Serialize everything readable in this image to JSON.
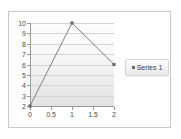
{
  "chart_data": {
    "type": "line",
    "title": "",
    "xlabel": "",
    "ylabel": "",
    "x": [
      0,
      1,
      2
    ],
    "series": [
      {
        "name": "Series 1",
        "values": [
          2,
          10,
          6
        ]
      }
    ],
    "xlim": [
      0,
      2
    ],
    "ylim": [
      2,
      10
    ],
    "xticks": [
      "0",
      "0.5",
      "1",
      "1.5",
      "2"
    ],
    "xtick_values": [
      0,
      0.5,
      1,
      1.5,
      2
    ],
    "yticks": [
      "2",
      "3",
      "4",
      "5",
      "6",
      "7",
      "8",
      "9",
      "10"
    ],
    "ytick_values": [
      2,
      3,
      4,
      5,
      6,
      7,
      8,
      9,
      10
    ],
    "grid": "horizontal",
    "legend_position": "right",
    "line_color": "#808080",
    "marker": "square",
    "marker_color": "#6b6b6b",
    "plot_bg_top": "#fdfdfd",
    "plot_bg_bottom": "#e3e3e3",
    "border_color": "#c8c8c8",
    "axis_color": "#9a9a9a",
    "gridline_color": "#d4d4d4",
    "tick_label_color": "#4a4a4a"
  },
  "legend": {
    "entries": [
      {
        "label": "Series 1",
        "marker_icon": "square-marker-icon"
      }
    ]
  }
}
